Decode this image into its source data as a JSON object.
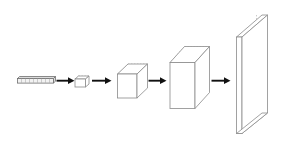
{
  "figure": {
    "background_color": "#ffffff",
    "width": 291,
    "height": 143,
    "stroke_color": "#8a8a8a",
    "hidden_edge_color": "#b4b4b4",
    "arrow_color": "#111111",
    "face_color": "#ffffff"
  },
  "stages": [
    {
      "id": "stage-1",
      "name": "input-vector-bar",
      "shape": "flat-bar",
      "label": "",
      "note": "thin horizontal segmented bar"
    },
    {
      "id": "stage-2",
      "name": "small-flat-cuboid",
      "shape": "cuboid",
      "label": "",
      "note": "small wide low box"
    },
    {
      "id": "stage-3",
      "name": "cube",
      "shape": "cube",
      "label": "",
      "note": "equal-sided cube"
    },
    {
      "id": "stage-4",
      "name": "tall-box",
      "shape": "cuboid",
      "label": "",
      "note": "tall deep rectangular box"
    },
    {
      "id": "stage-5",
      "name": "large-thin-slab",
      "shape": "slab",
      "label": "",
      "note": "large thin vertical plane"
    }
  ],
  "arrows": [
    {
      "id": "arrow-1",
      "name": "arrow-stage1-to-stage2",
      "label": ""
    },
    {
      "id": "arrow-2",
      "name": "arrow-stage2-to-stage3",
      "label": ""
    },
    {
      "id": "arrow-3",
      "name": "arrow-stage3-to-stage4",
      "label": ""
    },
    {
      "id": "arrow-4",
      "name": "arrow-stage4-to-stage5",
      "label": ""
    }
  ]
}
